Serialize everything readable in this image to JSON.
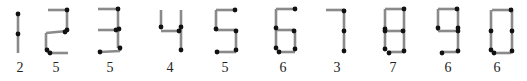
{
  "style": {
    "segment_color": "#8a8a8a",
    "dot_color": "#111111",
    "segment_width": 2.6,
    "dot_radius": 2.4
  },
  "digits": [
    {
      "glyph": "1",
      "count": "2",
      "label_x": 20,
      "segments": [
        [
          18,
          13,
          18,
          53
        ]
      ],
      "dots": [
        [
          18,
          14
        ],
        [
          18,
          34
        ]
      ]
    },
    {
      "glyph": "2",
      "count": "5",
      "label_x": 56,
      "segments": [
        [
          48,
          10,
          67,
          10
        ],
        [
          67,
          10,
          67,
          31
        ],
        [
          67,
          31,
          46,
          33
        ],
        [
          46,
          33,
          46,
          50
        ],
        [
          46,
          50,
          49,
          53
        ],
        [
          49,
          53,
          68,
          53
        ]
      ],
      "dots": [
        [
          67,
          10
        ],
        [
          67,
          30
        ],
        [
          65,
          32
        ],
        [
          47,
          50
        ],
        [
          50,
          53
        ]
      ]
    },
    {
      "glyph": "3",
      "count": "5",
      "label_x": 110,
      "segments": [
        [
          98,
          9,
          118,
          9
        ],
        [
          118,
          9,
          118,
          48
        ],
        [
          98,
          30,
          117,
          30
        ],
        [
          100,
          52,
          120,
          51
        ],
        [
          120,
          51,
          120,
          48
        ]
      ],
      "dots": [
        [
          118,
          9
        ],
        [
          116,
          30
        ],
        [
          119,
          29
        ],
        [
          120,
          48
        ],
        [
          100,
          52
        ]
      ]
    },
    {
      "glyph": "4",
      "count": "4",
      "label_x": 170,
      "segments": [
        [
          161,
          10,
          161,
          28
        ],
        [
          161,
          31,
          180,
          31
        ],
        [
          181,
          10,
          181,
          50
        ]
      ],
      "dots": [
        [
          161,
          27
        ],
        [
          181,
          27
        ],
        [
          179,
          31
        ],
        [
          181,
          50
        ]
      ]
    },
    {
      "glyph": "5",
      "count": "5",
      "label_x": 225,
      "segments": [
        [
          216,
          10,
          235,
          10
        ],
        [
          216,
          10,
          216,
          29
        ],
        [
          216,
          30,
          236,
          30
        ],
        [
          236,
          30,
          236,
          50
        ],
        [
          217,
          52,
          236,
          52
        ]
      ],
      "dots": [
        [
          235,
          10
        ],
        [
          216,
          29
        ],
        [
          236,
          31
        ],
        [
          236,
          50
        ],
        [
          217,
          52
        ]
      ]
    },
    {
      "glyph": "6",
      "count": "6",
      "label_x": 283,
      "segments": [
        [
          276,
          9,
          295,
          9
        ],
        [
          276,
          9,
          276,
          48
        ],
        [
          276,
          30,
          294,
          30
        ],
        [
          295,
          30,
          295,
          49
        ],
        [
          278,
          52,
          295,
          52
        ]
      ],
      "dots": [
        [
          295,
          9
        ],
        [
          276,
          28
        ],
        [
          294,
          31
        ],
        [
          276,
          48
        ],
        [
          279,
          52
        ],
        [
          295,
          49
        ]
      ]
    },
    {
      "glyph": "7",
      "count": "3",
      "label_x": 337,
      "segments": [
        [
          326,
          10,
          344,
          10
        ],
        [
          344,
          10,
          344,
          51
        ]
      ],
      "dots": [
        [
          344,
          11
        ],
        [
          344,
          31
        ],
        [
          344,
          51
        ]
      ]
    },
    {
      "glyph": "8",
      "count": "7",
      "label_x": 393,
      "segments": [
        [
          385,
          9,
          404,
          9
        ],
        [
          385,
          9,
          385,
          50
        ],
        [
          404,
          9,
          404,
          51
        ],
        [
          385,
          31,
          403,
          31
        ],
        [
          387,
          52,
          404,
          52
        ]
      ],
      "dots": [
        [
          404,
          9
        ],
        [
          385,
          29
        ],
        [
          385,
          31
        ],
        [
          403,
          31
        ],
        [
          385,
          49
        ],
        [
          389,
          53
        ],
        [
          404,
          51
        ]
      ]
    },
    {
      "glyph": "9",
      "count": "6",
      "label_x": 448,
      "segments": [
        [
          438,
          9,
          457,
          9
        ],
        [
          438,
          9,
          438,
          31
        ],
        [
          458,
          9,
          458,
          51
        ],
        [
          438,
          31,
          458,
          31
        ],
        [
          442,
          52,
          458,
          52
        ]
      ],
      "dots": [
        [
          457,
          9
        ],
        [
          438,
          28
        ],
        [
          458,
          28
        ],
        [
          458,
          31
        ],
        [
          458,
          51
        ],
        [
          442,
          53
        ]
      ]
    },
    {
      "glyph": "0",
      "count": "6",
      "label_x": 497,
      "segments": [
        [
          492,
          10,
          511,
          10
        ],
        [
          491,
          10,
          491,
          50
        ],
        [
          512,
          10,
          512,
          52
        ],
        [
          494,
          53,
          511,
          53
        ]
      ],
      "dots": [
        [
          511,
          10
        ],
        [
          491,
          31
        ],
        [
          512,
          31
        ],
        [
          491,
          50
        ],
        [
          494,
          53
        ],
        [
          512,
          51
        ]
      ]
    }
  ]
}
